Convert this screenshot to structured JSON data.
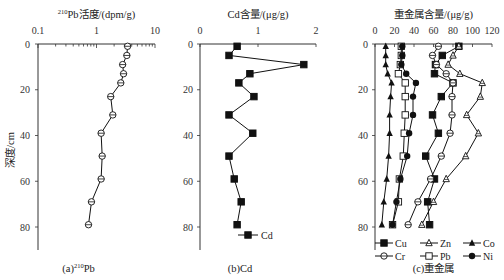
{
  "chart_data": [
    {
      "type": "line",
      "panel": "a",
      "title": "210Pb活度/(dpm/g)",
      "title_sup": "210",
      "title_rest": "Pb活度/(dpm/g)",
      "caption": "(a)210Pb",
      "caption_pre": "(a)",
      "caption_sup": "210",
      "caption_post": "Pb",
      "xlabel": "210Pb活度/(dpm/g)",
      "ylabel": "深度/cm",
      "xscale": "log",
      "xlim": [
        0.1,
        10
      ],
      "ylim": [
        90,
        0
      ],
      "xticks": [
        "0.1",
        "1",
        "10"
      ],
      "yticks": [
        "0",
        "20",
        "40",
        "60",
        "80"
      ],
      "series": [
        {
          "name": "210Pb",
          "marker": "open-circle-cross",
          "depth": [
            1,
            5,
            9,
            13,
            17,
            23,
            31,
            39,
            49,
            59,
            69,
            79
          ],
          "values": [
            3.4,
            3.3,
            2.8,
            2.9,
            2.6,
            1.75,
            1.9,
            1.2,
            1.25,
            1.2,
            0.82,
            0.73
          ]
        }
      ]
    },
    {
      "type": "line",
      "panel": "b",
      "title": "Cd含量/(μg/g)",
      "caption": "(b)Cd",
      "xlabel": "Cd含量/(μg/g)",
      "ylabel": "",
      "xlim": [
        0,
        2
      ],
      "ylim": [
        90,
        0
      ],
      "xticks": [
        "0",
        "1",
        "2"
      ],
      "yticks": [
        "0",
        "20",
        "40",
        "60",
        "80"
      ],
      "legend": [
        {
          "label": "Cd",
          "marker": "filled-square"
        }
      ],
      "series": [
        {
          "name": "Cd",
          "marker": "filled-square",
          "depth": [
            1,
            5,
            9,
            13,
            17,
            23,
            31,
            39,
            49,
            59,
            69,
            79
          ],
          "values": [
            0.64,
            0.5,
            1.79,
            0.86,
            0.67,
            0.93,
            0.5,
            0.91,
            0.5,
            0.59,
            0.71,
            0.64
          ]
        }
      ]
    },
    {
      "type": "line",
      "panel": "c",
      "title": "重金属含量/(μg/g)",
      "caption": "(c)重金属",
      "xlabel": "重金属含量/(μg/g)",
      "ylabel": "",
      "xlim": [
        0,
        120
      ],
      "ylim": [
        90,
        0
      ],
      "xticks": [
        "0",
        "20",
        "40",
        "60",
        "80",
        "100",
        "120"
      ],
      "yticks": [
        "0",
        "20",
        "40",
        "60",
        "80"
      ],
      "legend": [
        {
          "label": "Cu",
          "marker": "filled-square"
        },
        {
          "label": "Zn",
          "marker": "open-triangle"
        },
        {
          "label": "Co",
          "marker": "filled-triangle"
        },
        {
          "label": "Cr",
          "marker": "open-circle"
        },
        {
          "label": "Pb",
          "marker": "open-square"
        },
        {
          "label": "Ni",
          "marker": "filled-circle"
        }
      ],
      "depth": [
        1,
        5,
        9,
        13,
        17,
        23,
        31,
        39,
        49,
        59,
        69,
        79
      ],
      "series": [
        {
          "name": "Cu",
          "marker": "filled-square",
          "values": [
            86,
            69,
            62,
            61,
            80,
            68,
            59,
            65,
            52,
            61,
            54,
            56
          ]
        },
        {
          "name": "Zn",
          "marker": "open-triangle",
          "values": [
            86,
            80,
            75,
            87,
            110,
            108,
            94,
            106,
            93,
            73,
            60,
            48
          ]
        },
        {
          "name": "Co",
          "marker": "filled-triangle",
          "values": [
            11,
            11,
            11,
            13,
            17,
            16,
            15,
            15,
            14,
            12,
            9,
            7
          ]
        },
        {
          "name": "Cr",
          "marker": "open-circle",
          "values": [
            65,
            59,
            63,
            73,
            80,
            79,
            79,
            77,
            68,
            57,
            44,
            34
          ]
        },
        {
          "name": "Pb",
          "marker": "open-square",
          "values": [
            27,
            27,
            26,
            24,
            31,
            31,
            31,
            30,
            29,
            25,
            24,
            18
          ]
        },
        {
          "name": "Ni",
          "marker": "filled-circle",
          "values": [
            28,
            28,
            27,
            32,
            42,
            39,
            39,
            35,
            33,
            26,
            22,
            18
          ]
        }
      ]
    }
  ]
}
